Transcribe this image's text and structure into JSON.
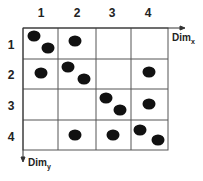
{
  "columns": [
    "1",
    "2",
    "3",
    "4"
  ],
  "rows": [
    "1",
    "2",
    "3",
    "4"
  ],
  "axis_x": {
    "label": "Dim",
    "sub": "x"
  },
  "axis_y": {
    "label": "Dim",
    "sub": "y"
  },
  "colors": {
    "grid": "#555555",
    "dot": "#111111"
  },
  "cells": [
    {
      "row": 1,
      "col": 1,
      "points": 2
    },
    {
      "row": 1,
      "col": 2,
      "points": 1
    },
    {
      "row": 2,
      "col": 1,
      "points": 1
    },
    {
      "row": 2,
      "col": 2,
      "points": 2
    },
    {
      "row": 2,
      "col": 4,
      "points": 1
    },
    {
      "row": 3,
      "col": 3,
      "points": 2
    },
    {
      "row": 3,
      "col": 4,
      "points": 1
    },
    {
      "row": 4,
      "col": 2,
      "points": 1
    },
    {
      "row": 4,
      "col": 3,
      "points": 1
    },
    {
      "row": 4,
      "col": 4,
      "points": 2
    }
  ]
}
